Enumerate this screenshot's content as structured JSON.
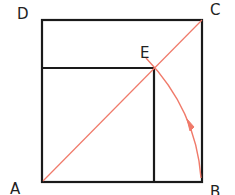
{
  "diagram": {
    "labels": {
      "A": "A",
      "B": "B",
      "C": "C",
      "D": "D",
      "E": "E"
    },
    "colors": {
      "lines": "#1a1a1a",
      "construction": "#f07a6a",
      "background": "#ffffff"
    }
  }
}
